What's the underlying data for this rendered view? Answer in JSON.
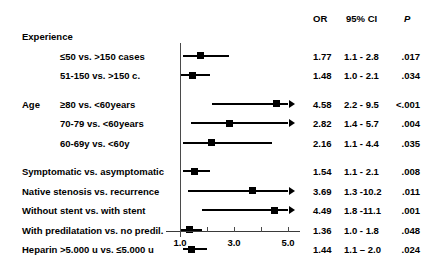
{
  "chart_data": {
    "type": "scatter",
    "subtype": "forest-plot",
    "title": "",
    "xlabel": "",
    "ylabel": "",
    "xlim": [
      1.0,
      5.0
    ],
    "xticks": [
      1.0,
      2.0,
      3.0,
      4.0,
      5.0
    ],
    "xticklabels": [
      "1.0",
      "",
      "3.0",
      "",
      "5.0"
    ],
    "reference_line": 1.0,
    "grid": false,
    "legend": "none",
    "columns": [
      "OR",
      "95% CI",
      "P"
    ],
    "rows": [
      {
        "kind": "group",
        "label": "Experience"
      },
      {
        "kind": "data",
        "label": "≤50 vs. >150 cases",
        "indent": 1,
        "or": 1.77,
        "ci_low": 1.1,
        "ci_high": 2.8,
        "p": ".017",
        "or_text": "1.77",
        "ci_text": "1.1 - 2.8",
        "clipped": false
      },
      {
        "kind": "data",
        "label": "51-150 vs. >150 c.",
        "indent": 1,
        "or": 1.48,
        "ci_low": 1.0,
        "ci_high": 2.1,
        "p": ".034",
        "or_text": "1.48",
        "ci_text": "1.0 - 2.1",
        "clipped": false
      },
      {
        "kind": "spacer"
      },
      {
        "kind": "data",
        "label": "≥80 vs. <60years",
        "prefix": "Age",
        "indent": 1,
        "or": 4.58,
        "ci_low": 2.2,
        "ci_high": 9.5,
        "p": "<.001",
        "or_text": "4.58",
        "ci_text": "2.2 - 9.5",
        "clipped": true
      },
      {
        "kind": "data",
        "label": "70-79 vs. <60years",
        "indent": 1,
        "or": 2.82,
        "ci_low": 1.4,
        "ci_high": 5.7,
        "p": ".004",
        "or_text": "2.82",
        "ci_text": "1.4 - 5.7",
        "clipped": true
      },
      {
        "kind": "data",
        "label": "60-69y vs. <60y",
        "indent": 1,
        "or": 2.16,
        "ci_low": 1.1,
        "ci_high": 4.4,
        "p": ".035",
        "or_text": "2.16",
        "ci_text": "1.1 - 4.4",
        "clipped": false
      },
      {
        "kind": "spacer"
      },
      {
        "kind": "data",
        "label": "Symptomatic vs. asymptomatic",
        "indent": 0,
        "or": 1.54,
        "ci_low": 1.1,
        "ci_high": 2.1,
        "p": ".008",
        "or_text": "1.54",
        "ci_text": "1.1 - 2.1",
        "clipped": false
      },
      {
        "kind": "data",
        "label": "Native stenosis vs. recurrence",
        "indent": 0,
        "or": 3.69,
        "ci_low": 1.3,
        "ci_high": 10.2,
        "p": ".011",
        "or_text": "3.69",
        "ci_text": "1.3 -10.2",
        "clipped": true
      },
      {
        "kind": "data",
        "label": "Without stent vs. with stent",
        "indent": 0,
        "or": 4.49,
        "ci_low": 1.8,
        "ci_high": 11.1,
        "p": ".001",
        "or_text": "4.49",
        "ci_text": "1.8 -11.1",
        "clipped": true
      },
      {
        "kind": "data",
        "label": "With predilatation vs. no predil.",
        "indent": 0,
        "or": 1.36,
        "ci_low": 1.0,
        "ci_high": 1.8,
        "p": ".048",
        "or_text": "1.36",
        "ci_text": "1.0 - 1.8",
        "clipped": false
      },
      {
        "kind": "data",
        "label": "Heparin >5.000 u vs. ≤5.000 u",
        "indent": 0,
        "or": 1.44,
        "ci_low": 1.1,
        "ci_high": 2.0,
        "p": ".024",
        "or_text": "1.44",
        "ci_text": "1.1 – 2.0",
        "clipped": false
      }
    ]
  },
  "header": {
    "or": "OR",
    "ci": "95% CI",
    "p": "P"
  },
  "colors": {
    "marker": "#000000",
    "axis": "#4a4a4a",
    "text": "#000000",
    "background": "#ffffff"
  }
}
